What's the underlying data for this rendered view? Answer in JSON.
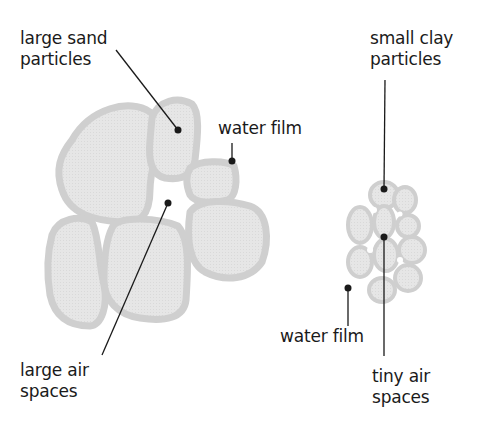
{
  "diagram": {
    "colors": {
      "particle_fill": "#e4e4e4",
      "water_film": "#cfcfcf",
      "line": "#1a1a1a",
      "background": "#ffffff"
    },
    "sandy_soil": {
      "labels": {
        "particles_line1": "large sand",
        "particles_line2": "particles",
        "water_film": "water film",
        "air_line1": "large air",
        "air_line2": "spaces"
      }
    },
    "clay_soil": {
      "labels": {
        "particles_line1": "small clay",
        "particles_line2": "particles",
        "water_film": "water film",
        "air_line1": "tiny air",
        "air_line2": "spaces"
      }
    }
  }
}
